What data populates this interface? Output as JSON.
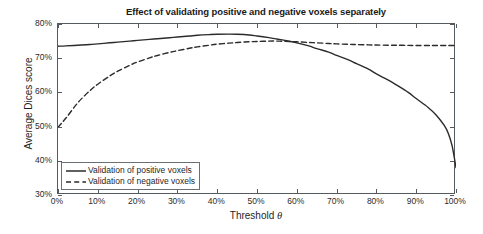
{
  "chart_data": {
    "type": "line",
    "title": "Effect of validating positive and negative voxels separately",
    "xlabel": "Threshold θ",
    "ylabel": "Average Dices score",
    "xlim": [
      0,
      100
    ],
    "ylim": [
      30,
      80
    ],
    "grid": false,
    "legend_position": "lower left (inside axes)",
    "xticks": [
      0,
      10,
      20,
      30,
      40,
      50,
      60,
      70,
      80,
      90,
      100
    ],
    "xtick_labels": [
      "0%",
      "10%",
      "20%",
      "30%",
      "40%",
      "50%",
      "60%",
      "70%",
      "80%",
      "90%",
      "100%"
    ],
    "yticks": [
      30,
      40,
      50,
      60,
      70,
      80
    ],
    "ytick_labels": [
      "30%",
      "40%",
      "50%",
      "60%",
      "70%",
      "80%"
    ],
    "x": [
      0,
      2,
      5,
      8,
      10,
      13,
      15,
      18,
      20,
      23,
      25,
      28,
      30,
      33,
      35,
      38,
      40,
      43,
      45,
      48,
      50,
      53,
      55,
      57,
      60,
      63,
      65,
      68,
      70,
      73,
      75,
      78,
      80,
      83,
      85,
      88,
      90,
      93,
      95,
      97,
      98,
      99,
      100
    ],
    "series": [
      {
        "name": "Validation of positive voxels",
        "style": "solid",
        "color": "#2b2b2b",
        "values": [
          73.5,
          73.6,
          73.8,
          74.0,
          74.2,
          74.5,
          74.7,
          75.0,
          75.2,
          75.5,
          75.7,
          76.0,
          76.2,
          76.5,
          76.7,
          76.9,
          77.0,
          77.05,
          77.0,
          76.8,
          76.5,
          76.0,
          75.6,
          75.2,
          74.5,
          73.6,
          72.8,
          71.8,
          70.8,
          69.5,
          68.4,
          66.8,
          65.4,
          63.6,
          62.2,
          60.0,
          58.2,
          55.6,
          53.4,
          50.4,
          48.2,
          44.5,
          38.0
        ]
      },
      {
        "name": "Validation of negative voxels",
        "style": "dashed",
        "color": "#2b2b2b",
        "values": [
          49.8,
          52.5,
          57.0,
          60.5,
          62.4,
          64.8,
          66.2,
          67.9,
          68.9,
          70.1,
          70.8,
          71.7,
          72.2,
          72.9,
          73.3,
          73.8,
          74.1,
          74.4,
          74.6,
          74.8,
          74.9,
          75.0,
          75.0,
          74.95,
          74.8,
          74.6,
          74.5,
          74.3,
          74.2,
          74.05,
          74.0,
          73.9,
          73.85,
          73.8,
          73.78,
          73.75,
          73.72,
          73.7,
          73.7,
          73.7,
          73.7,
          73.7,
          73.7
        ]
      }
    ]
  },
  "legend": {
    "items": [
      {
        "label": "Validation of positive voxels",
        "style": "solid"
      },
      {
        "label": "Validation of negative voxels",
        "style": "dashed"
      }
    ]
  },
  "axis_label_x_prefix": "Threshold ",
  "axis_label_x_symbol": "θ",
  "colors": {
    "line": "#2b2b2b",
    "axis": "#555a5e",
    "text": "#1f1f1f",
    "background": "#ffffff"
  }
}
